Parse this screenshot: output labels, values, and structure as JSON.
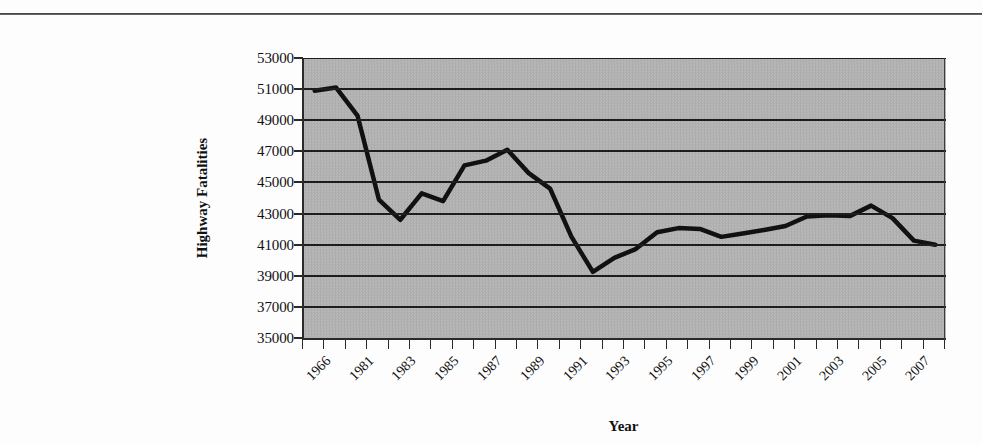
{
  "figure": {
    "top_rule": true,
    "background_color": "#fdfdfd",
    "plot_background_color": "#b2b2b2",
    "line_color": "#111111",
    "gridline_color": "#1d1d1d"
  },
  "chart_data": {
    "type": "line",
    "title": "",
    "xlabel": "Year",
    "ylabel": "Highway Fatalities",
    "ylim": [
      35000,
      53000
    ],
    "ytick_labels": [
      "53000",
      "51000",
      "49000",
      "47000",
      "45000",
      "43000",
      "41000",
      "39000",
      "37000",
      "35000"
    ],
    "ytick_values": [
      53000,
      51000,
      49000,
      47000,
      45000,
      43000,
      41000,
      39000,
      37000,
      35000
    ],
    "grid": true,
    "grid_axis": "y",
    "legend": false,
    "legend_position": "none",
    "categories": [
      "1966",
      "1980",
      "1981",
      "1982",
      "1983",
      "1984",
      "1985",
      "1986",
      "1987",
      "1988",
      "1989",
      "1990",
      "1991",
      "1992",
      "1993",
      "1994",
      "1995",
      "1996",
      "1997",
      "1998",
      "1999",
      "2000",
      "2001",
      "2002",
      "2003",
      "2004",
      "2005",
      "2006",
      "2007",
      "2008"
    ],
    "xtick_labels_shown": [
      "1966",
      "1981",
      "1983",
      "1985",
      "1987",
      "1989",
      "1991",
      "1993",
      "1995",
      "1997",
      "1999",
      "2001",
      "2003",
      "2005",
      "2007"
    ],
    "xtick_label_rotation": -45,
    "values": [
      50900,
      51100,
      49300,
      43900,
      42600,
      44300,
      43800,
      46100,
      46400,
      47100,
      45600,
      44600,
      41500,
      39250,
      40150,
      40716,
      41800,
      42065,
      42013,
      41501,
      41717,
      41945,
      42196,
      42815,
      42884,
      42836,
      43510,
      42708,
      41259,
      41000
    ],
    "series": [
      {
        "name": "Highway Fatalities",
        "values": [
          50900,
          51100,
          49300,
          43900,
          42600,
          44300,
          43800,
          46100,
          46400,
          47100,
          45600,
          44600,
          41500,
          39250,
          40150,
          40716,
          41800,
          42065,
          42013,
          41501,
          41717,
          41945,
          42196,
          42815,
          42884,
          42836,
          43510,
          42708,
          41259,
          41000
        ]
      }
    ]
  }
}
